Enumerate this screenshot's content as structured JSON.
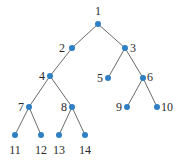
{
  "diagram": {
    "type": "tree",
    "node_color": "#2f7fc4",
    "edge_color": "#6b6b6b",
    "nodes": [
      {
        "id": "1",
        "label": "1"
      },
      {
        "id": "2",
        "label": "2"
      },
      {
        "id": "3",
        "label": "3"
      },
      {
        "id": "4",
        "label": "4"
      },
      {
        "id": "5",
        "label": "5"
      },
      {
        "id": "6",
        "label": "6"
      },
      {
        "id": "7",
        "label": "7"
      },
      {
        "id": "8",
        "label": "8"
      },
      {
        "id": "9",
        "label": "9"
      },
      {
        "id": "10",
        "label": "10"
      },
      {
        "id": "11",
        "label": "11"
      },
      {
        "id": "12",
        "label": "12"
      },
      {
        "id": "13",
        "label": "13"
      },
      {
        "id": "14",
        "label": "14"
      }
    ],
    "edges": [
      [
        "1",
        "2"
      ],
      [
        "1",
        "3"
      ],
      [
        "2",
        "4"
      ],
      [
        "3",
        "5"
      ],
      [
        "3",
        "6"
      ],
      [
        "4",
        "7"
      ],
      [
        "4",
        "8"
      ],
      [
        "6",
        "9"
      ],
      [
        "6",
        "10"
      ],
      [
        "7",
        "11"
      ],
      [
        "7",
        "12"
      ],
      [
        "8",
        "13"
      ],
      [
        "8",
        "14"
      ]
    ]
  }
}
